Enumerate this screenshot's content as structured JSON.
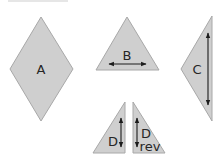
{
  "diagram": {
    "title_clipped": "",
    "colors": {
      "fill": "#cfcfcf",
      "stroke": "#a8a8a8",
      "text": "#262626",
      "arrow": "#1c1c1c"
    },
    "shapes": [
      {
        "id": "A",
        "type": "diamond",
        "label": "A"
      },
      {
        "id": "B",
        "type": "triangle",
        "label": "B",
        "arrow": "horizontal-double"
      },
      {
        "id": "C",
        "type": "triangle",
        "label": "C",
        "arrow": "vertical-double"
      },
      {
        "id": "D",
        "type": "right-triangle",
        "label": "D",
        "arrow": "vertical-double"
      },
      {
        "id": "Drev",
        "type": "right-triangle-reversed",
        "label_line1": "D",
        "label_line2": "rev",
        "arrow": "vertical-double"
      }
    ]
  }
}
